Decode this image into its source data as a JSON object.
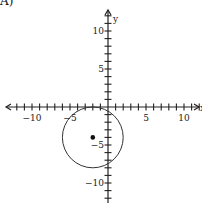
{
  "option_label": "A)",
  "chart_data": {
    "type": "scatter",
    "title": "",
    "xlabel": "x",
    "ylabel": "y",
    "xlim": [
      -13,
      13
    ],
    "ylim": [
      -13,
      13
    ],
    "grid": false,
    "x_tick_labels": [
      "-10",
      "-5",
      "5",
      "10"
    ],
    "y_tick_labels": [
      "10",
      "5",
      "-5",
      "-10"
    ],
    "x_tick_values": [
      -10,
      -5,
      5,
      10
    ],
    "y_tick_values": [
      10,
      5,
      -5,
      -10
    ],
    "shapes": [
      {
        "kind": "circle",
        "center": [
          -2,
          -4
        ],
        "radius": 4
      }
    ],
    "points": [
      {
        "x": -2,
        "y": -4,
        "label": "center"
      }
    ]
  },
  "axis_labels": {
    "x": "x",
    "y": "y"
  }
}
